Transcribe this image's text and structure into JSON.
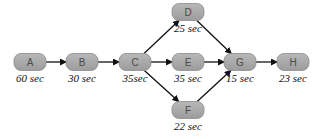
{
  "diagram": {
    "type": "activity-network",
    "nodes": [
      {
        "id": "A",
        "label": "A",
        "duration": "60 sec",
        "cx": 30,
        "cy": 62
      },
      {
        "id": "B",
        "label": "B",
        "duration": "30 sec",
        "cx": 82,
        "cy": 62
      },
      {
        "id": "C",
        "label": "C",
        "duration": "35sec",
        "cx": 135,
        "cy": 62
      },
      {
        "id": "D",
        "label": "D",
        "duration": "25 sec",
        "cx": 188,
        "cy": 12
      },
      {
        "id": "E",
        "label": "E",
        "duration": "35 sec",
        "cx": 188,
        "cy": 62
      },
      {
        "id": "F",
        "label": "F",
        "duration": "22 sec",
        "cx": 188,
        "cy": 110
      },
      {
        "id": "G",
        "label": "G",
        "duration": "15 sec",
        "cx": 240,
        "cy": 62
      },
      {
        "id": "H",
        "label": "H",
        "duration": "23 sec",
        "cx": 293,
        "cy": 62
      }
    ],
    "edges": [
      {
        "from": "A",
        "to": "B"
      },
      {
        "from": "B",
        "to": "C"
      },
      {
        "from": "C",
        "to": "D"
      },
      {
        "from": "C",
        "to": "E"
      },
      {
        "from": "C",
        "to": "F"
      },
      {
        "from": "D",
        "to": "G"
      },
      {
        "from": "E",
        "to": "G"
      },
      {
        "from": "F",
        "to": "G"
      },
      {
        "from": "G",
        "to": "H"
      }
    ],
    "colors": {
      "node_fill": "#a8a8a8",
      "node_text": "#4a4a4a",
      "edge": "#111111",
      "duration_text": "#111111"
    }
  }
}
